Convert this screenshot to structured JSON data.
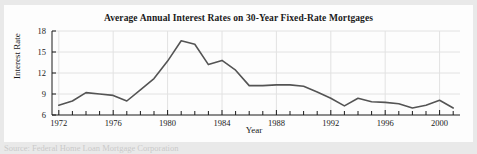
{
  "figure": {
    "background_color": "#e9e9e9",
    "panel_color": "#fdfdfd"
  },
  "footer": {
    "text": "Source: Federal Home Loan Mortgage Corporation"
  },
  "chart_data": {
    "type": "line",
    "title": "Average Annual Interest Rates on 30-Year Fixed-Rate Mortgages",
    "xlabel": "Year",
    "ylabel": "Interest Rate",
    "xlim": [
      1971.5,
      2001.5
    ],
    "ylim": [
      6,
      18
    ],
    "yticks": [
      6,
      9,
      12,
      15,
      18
    ],
    "ytick_labels": [
      "6",
      "9",
      "12",
      "15",
      "18"
    ],
    "xticks": [
      1972,
      1973,
      1974,
      1975,
      1976,
      1977,
      1978,
      1979,
      1980,
      1981,
      1982,
      1983,
      1984,
      1985,
      1986,
      1987,
      1988,
      1989,
      1990,
      1991,
      1992,
      1993,
      1994,
      1995,
      1996,
      1997,
      1998,
      1999,
      2000,
      2001
    ],
    "xtick_labels_major": [
      "1972",
      "1976",
      "1980",
      "1984",
      "1988",
      "1992",
      "1996",
      "2000"
    ],
    "xticks_major": [
      1972,
      1976,
      1980,
      1984,
      1988,
      1992,
      1996,
      2000
    ],
    "grid": true,
    "grid_color": "#e2e2e2",
    "legend": null,
    "line_color": "#545454",
    "line_width": 1.6,
    "x": [
      1972,
      1973,
      1974,
      1975,
      1976,
      1977,
      1978,
      1979,
      1980,
      1981,
      1982,
      1983,
      1984,
      1985,
      1986,
      1987,
      1988,
      1989,
      1990,
      1991,
      1992,
      1993,
      1994,
      1995,
      1996,
      1997,
      1998,
      1999,
      2000,
      2001
    ],
    "values": [
      7.4,
      8.0,
      9.2,
      9.0,
      8.8,
      8.0,
      9.6,
      11.2,
      13.7,
      16.6,
      16.1,
      13.2,
      13.8,
      12.4,
      10.2,
      10.2,
      10.3,
      10.3,
      10.1,
      9.3,
      8.4,
      7.3,
      8.4,
      7.9,
      7.8,
      7.6,
      7.0,
      7.4,
      8.1,
      7.0
    ],
    "series_name": "30-Year Fixed-Rate Mortgage Average Annual Interest Rate",
    "series_units": "percent"
  }
}
